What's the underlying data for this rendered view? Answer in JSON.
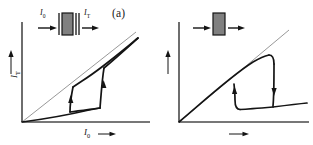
{
  "figure": {
    "background_color": "#ffffff",
    "ink_color": "#141414",
    "reference_line_color": "#8c8c8c",
    "panels": [
      {
        "id": "a",
        "tag": "(a)",
        "axes": {
          "x_label": "I",
          "x_label_sub": "0",
          "x_arrow": "→",
          "y_label": "I",
          "y_label_sub": "T",
          "y_arrow": "→",
          "origin_px": [
            22,
            122
          ],
          "x_end_px": [
            150,
            122
          ],
          "y_top_px": [
            22,
            22
          ]
        },
        "reference_line": {
          "name": "unity-transmission-line",
          "from": [
            22,
            122
          ],
          "to": [
            135,
            33
          ],
          "color": "#8c8c8c",
          "width": 0.9
        },
        "inset": {
          "type": "fabry-perot-cavity",
          "description": "mirror | absorbing medium | mirror",
          "input_label": "I",
          "input_label_sub": "0",
          "output_label": "I",
          "output_label_sub": "T",
          "medium_fill": "#808080",
          "box_px": [
            59,
            13,
            14,
            22
          ]
        },
        "curve": {
          "name": "bistable-hysteresis-loop",
          "shape": "counter-clockwise S-shaped switching loop",
          "lower_branch": [
            [
              22,
              122
            ],
            [
              50,
              118
            ],
            [
              75,
              113
            ],
            [
              92,
              110
            ],
            [
              100,
              108
            ]
          ],
          "switch_up_right": [
            [
              100,
              108
            ],
            [
              101,
              96
            ],
            [
              103,
              82
            ],
            [
              104,
              70
            ]
          ],
          "upper_branch": [
            [
              104,
              70
            ],
            [
              118,
              57
            ],
            [
              130,
              46
            ],
            [
              138,
              39
            ]
          ],
          "return_branch": [
            [
              138,
              39
            ],
            [
              120,
              54
            ],
            [
              100,
              70
            ],
            [
              82,
              82
            ],
            [
              72,
              88
            ]
          ],
          "switch_down_left": [
            [
              72,
              88
            ],
            [
              71,
              98
            ],
            [
              70,
              107
            ],
            [
              70,
              112
            ]
          ],
          "arrows": [
            {
              "at": [
                104,
                86
              ],
              "direction": "up"
            },
            {
              "at": [
                71,
                100
              ],
              "direction": "up"
            }
          ]
        }
      },
      {
        "id": "b",
        "tag": "(b)",
        "axes": {
          "x_label": "I",
          "x_label_sub": "0",
          "x_arrow": "→",
          "y_label": "I",
          "y_label_sub": "T",
          "y_arrow": "→",
          "origin_px": [
            22,
            122
          ],
          "x_end_px": [
            150,
            122
          ],
          "y_top_px": [
            22,
            22
          ]
        },
        "reference_line": {
          "name": "unity-transmission-line",
          "from": [
            22,
            122
          ],
          "to": [
            130,
            32
          ],
          "color": "#8c8c8c",
          "width": 0.9
        },
        "inset": {
          "type": "nonlinear-absorber-block",
          "description": "single absorbing slab",
          "input_label": "I",
          "input_label_sub": "0",
          "output_label": "I",
          "output_label_sub": "T",
          "medium_fill": "#808080",
          "box_px": [
            56,
            13,
            12,
            22
          ]
        },
        "curve": {
          "name": "inverted-hysteresis-loop",
          "shape": "clockwise switch-down loop",
          "rising_branch": [
            [
              22,
              122
            ],
            [
              45,
              100
            ],
            [
              66,
              82
            ],
            [
              85,
              68
            ],
            [
              100,
              59
            ],
            [
              110,
              56
            ]
          ],
          "switch_down_right": [
            [
              112,
              56
            ],
            [
              113,
              70
            ],
            [
              114,
              90
            ],
            [
              114,
              107
            ]
          ],
          "lower_right_branch": [
            [
              114,
              107
            ],
            [
              128,
              105
            ],
            [
              140,
              103
            ],
            [
              148,
              102
            ]
          ],
          "lower_left_branch": [
            [
              114,
              107
            ],
            [
              100,
              108
            ],
            [
              88,
              109
            ],
            [
              80,
              109
            ]
          ],
          "switch_up_left": [
            [
              78,
              108
            ],
            [
              77,
              98
            ],
            [
              76,
              90
            ],
            [
              76,
              84
            ]
          ],
          "arrows": [
            {
              "at": [
                113,
                86
              ],
              "direction": "down"
            },
            {
              "at": [
                77,
                95
              ],
              "direction": "up"
            }
          ]
        }
      }
    ]
  }
}
